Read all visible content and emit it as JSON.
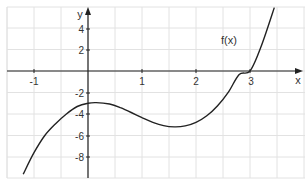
{
  "chart_data": {
    "type": "line",
    "title": "",
    "xlabel": "x",
    "ylabel": "y",
    "xlim": [
      -1.5,
      4.0
    ],
    "ylim": [
      -10,
      6.5
    ],
    "grid": true,
    "x_ticks": [
      -1,
      1,
      2,
      3
    ],
    "y_ticks": [
      4,
      2,
      -2,
      -4,
      -6,
      -8
    ],
    "x_tick_labels": [
      "-1",
      "1",
      "2",
      "3"
    ],
    "y_tick_labels": [
      "4",
      "2",
      "-2",
      "-4",
      "-6",
      "-8"
    ],
    "series": [
      {
        "name": "f(x)",
        "label": "f(x)",
        "color": "#222222",
        "x": [
          -1.2,
          -1.0,
          -0.8,
          -0.6,
          -0.4,
          -0.2,
          0.0,
          0.15,
          0.4,
          0.6,
          0.8,
          1.0,
          1.2,
          1.4,
          1.6,
          1.8,
          2.0,
          2.2,
          2.4,
          2.6,
          2.8,
          3.0,
          3.2,
          3.45
        ],
        "y": [
          -9.6,
          -7.6,
          -6.0,
          -4.9,
          -4.0,
          -3.3,
          -3.0,
          -2.94,
          -3.07,
          -3.41,
          -3.86,
          -4.34,
          -4.77,
          -5.08,
          -5.2,
          -5.11,
          -4.78,
          -4.17,
          -3.24,
          -1.97,
          -0.33,
          0.0,
          2.2,
          5.9
        ]
      }
    ],
    "annotations": [
      {
        "text": "f(x)",
        "x": 2.85,
        "y": 2.8
      }
    ]
  },
  "labels": {
    "x_axis": "x",
    "y_axis": "y",
    "curve": "f(x)",
    "xt_m1": "-1",
    "xt_1": "1",
    "xt_2": "2",
    "xt_3": "3",
    "yt_4": "4",
    "yt_2": "2",
    "yt_m2": "-2",
    "yt_m4": "-4",
    "yt_m6": "-6",
    "yt_m8": "-8"
  },
  "colors": {
    "grid": "#e2e2e2",
    "axis": "#222222",
    "curve": "#222222"
  }
}
